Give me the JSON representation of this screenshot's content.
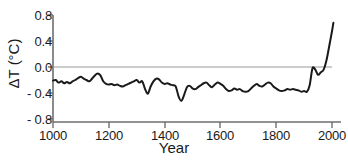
{
  "chart_data": {
    "type": "line",
    "title": "",
    "subtitle": "",
    "xlabel": "Year",
    "ylabel": "ΔT (°C)",
    "xlim": [
      1000,
      2020
    ],
    "ylim": [
      -0.8,
      0.8
    ],
    "grid": false,
    "legend": "none",
    "zero_line": true,
    "zero_line_color": "#9a9a9a",
    "line_color": "#1a1a1a",
    "axis_color": "#6e6e6e",
    "background": "#ffffff",
    "xticks": [
      1000,
      1200,
      1400,
      1600,
      1800,
      2000
    ],
    "xticklabels": [
      "1000",
      "1200",
      "1400",
      "1600",
      "1800",
      "2000"
    ],
    "yticks": [
      0.8,
      0.4,
      0.0,
      -0.4,
      -0.8
    ],
    "yticklabels": [
      "0.8",
      "0.4",
      "0.0",
      "- 0.4",
      "- 0.8"
    ],
    "series": [
      {
        "name": "Northern Hemisphere temperature anomaly",
        "x": [
          1000,
          1010,
          1020,
          1030,
          1040,
          1050,
          1060,
          1070,
          1080,
          1090,
          1100,
          1110,
          1120,
          1130,
          1140,
          1150,
          1160,
          1170,
          1180,
          1190,
          1200,
          1210,
          1220,
          1230,
          1240,
          1250,
          1260,
          1270,
          1280,
          1290,
          1300,
          1310,
          1320,
          1330,
          1340,
          1350,
          1360,
          1370,
          1380,
          1390,
          1400,
          1410,
          1420,
          1430,
          1440,
          1450,
          1460,
          1470,
          1480,
          1490,
          1500,
          1510,
          1520,
          1530,
          1540,
          1550,
          1560,
          1570,
          1580,
          1590,
          1600,
          1610,
          1620,
          1630,
          1640,
          1650,
          1660,
          1670,
          1680,
          1690,
          1700,
          1710,
          1720,
          1730,
          1740,
          1750,
          1760,
          1770,
          1780,
          1790,
          1800,
          1810,
          1820,
          1830,
          1840,
          1850,
          1860,
          1870,
          1880,
          1890,
          1900,
          1910,
          1920,
          1930,
          1940,
          1950,
          1960,
          1970,
          1980,
          1990,
          2000,
          2005
        ],
        "y": [
          -0.21,
          -0.2,
          -0.24,
          -0.22,
          -0.25,
          -0.23,
          -0.25,
          -0.22,
          -0.2,
          -0.17,
          -0.15,
          -0.18,
          -0.2,
          -0.22,
          -0.18,
          -0.13,
          -0.1,
          -0.13,
          -0.22,
          -0.26,
          -0.27,
          -0.26,
          -0.28,
          -0.27,
          -0.29,
          -0.3,
          -0.28,
          -0.26,
          -0.24,
          -0.22,
          -0.2,
          -0.24,
          -0.22,
          -0.34,
          -0.41,
          -0.3,
          -0.22,
          -0.18,
          -0.19,
          -0.24,
          -0.26,
          -0.25,
          -0.27,
          -0.28,
          -0.3,
          -0.45,
          -0.52,
          -0.43,
          -0.31,
          -0.29,
          -0.33,
          -0.34,
          -0.31,
          -0.28,
          -0.25,
          -0.24,
          -0.28,
          -0.31,
          -0.27,
          -0.24,
          -0.26,
          -0.29,
          -0.34,
          -0.37,
          -0.36,
          -0.33,
          -0.35,
          -0.34,
          -0.37,
          -0.38,
          -0.37,
          -0.33,
          -0.29,
          -0.26,
          -0.29,
          -0.3,
          -0.27,
          -0.24,
          -0.25,
          -0.3,
          -0.33,
          -0.36,
          -0.37,
          -0.36,
          -0.34,
          -0.35,
          -0.34,
          -0.35,
          -0.36,
          -0.38,
          -0.37,
          -0.38,
          -0.28,
          -0.02,
          -0.04,
          -0.12,
          -0.08,
          -0.04,
          0.1,
          0.32,
          0.55,
          0.68
        ],
        "color": "#1a1a1a",
        "linewidth": 2
      }
    ],
    "annotations": []
  }
}
